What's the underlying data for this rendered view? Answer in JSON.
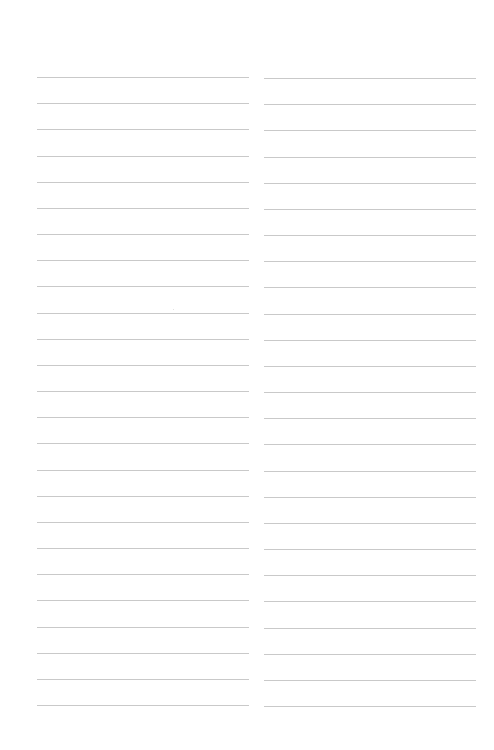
{
  "page": {
    "type": "blank-lined-sheet",
    "background": "#ffffff",
    "rule_color": "#c9c9c9"
  },
  "layout": {
    "columns": 2,
    "lines_per_column": 25,
    "first_line_y": 77,
    "line_spacing": 26.17,
    "columns_spec": [
      {
        "name": "left",
        "x": 37,
        "width": 212,
        "y_offset": 0
      },
      {
        "name": "right",
        "x": 264,
        "width": 212,
        "y_offset": 1
      }
    ]
  },
  "content": {
    "text": ""
  }
}
